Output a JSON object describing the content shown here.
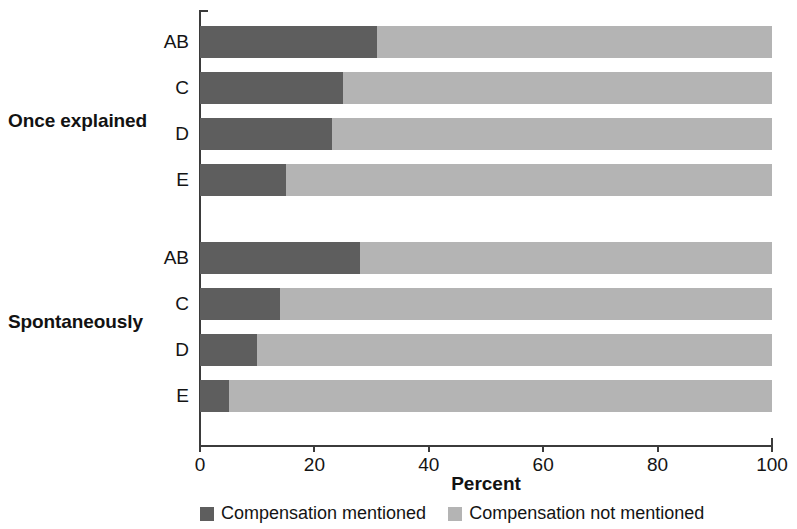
{
  "chart_data": {
    "type": "bar",
    "subtype": "horizontal-stacked-100-percent",
    "title": "",
    "xlabel": "Percent",
    "ylabel": "",
    "xlim": [
      0,
      100
    ],
    "xticks": [
      0,
      20,
      40,
      60,
      80,
      100
    ],
    "xticklabels": [
      "0",
      "20",
      "40",
      "60",
      "80",
      "100"
    ],
    "grid": false,
    "legend_position": "bottom",
    "categories": [
      "AB",
      "C",
      "D",
      "E"
    ],
    "groups": [
      {
        "name": "Once explained",
        "categories": [
          "AB",
          "C",
          "D",
          "E"
        ],
        "series": [
          {
            "name": "Compensation mentioned",
            "values": [
              31,
              25,
              23,
              15
            ]
          },
          {
            "name": "Compensation not mentioned",
            "values": [
              69,
              75,
              77,
              85
            ]
          }
        ]
      },
      {
        "name": "Spontaneously",
        "categories": [
          "AB",
          "C",
          "D",
          "E"
        ],
        "series": [
          {
            "name": "Compensation mentioned",
            "values": [
              28,
              14,
              10,
              5
            ]
          },
          {
            "name": "Compensation not mentioned",
            "values": [
              72,
              86,
              90,
              95
            ]
          }
        ]
      }
    ],
    "legend": [
      {
        "label": "Compensation mentioned",
        "color": "#5e5e5e"
      },
      {
        "label": "Compensation not mentioned",
        "color": "#b4b4b4"
      }
    ],
    "colors": {
      "mentioned": "#5e5e5e",
      "not_mentioned": "#b4b4b4",
      "axis": "#3b3b3b",
      "text": "#141414",
      "background": "#ffffff"
    }
  }
}
